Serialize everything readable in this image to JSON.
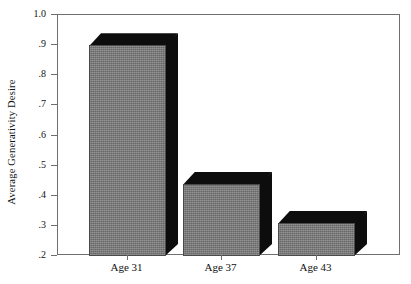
{
  "chart_data": {
    "type": "bar",
    "title": "",
    "subtitle": "",
    "xlabel": "",
    "ylabel": "Average Generativity Desire",
    "categories": [
      "Age 31",
      "Age 37",
      "Age 43"
    ],
    "values": [
      0.9,
      0.44,
      0.31
    ],
    "series": [
      {
        "name": "Average Generativity Desire",
        "values": [
          0.9,
          0.44,
          0.31
        ]
      }
    ],
    "ylim": [
      0.2,
      1.0
    ],
    "ytick_labels": [
      "1.0",
      ".9",
      ".8",
      ".7",
      ".6",
      ".5",
      ".4",
      ".3",
      ".2"
    ],
    "ytick_values": [
      1.0,
      0.9,
      0.8,
      0.7,
      0.6,
      0.5,
      0.4,
      0.3,
      0.2
    ],
    "grid": false,
    "legend": false,
    "legend_position": "none",
    "style": "3d-bar",
    "colors": {
      "bar_front": "#7d7d7d",
      "bar_shadow": "#0d0d0d",
      "axis": "#6f6f6f",
      "text": "#111111",
      "background": "#ffffff"
    },
    "annotations": []
  },
  "axes": {
    "y_title": "Average Generativity Desire",
    "y_ticks": [
      {
        "label": "1.0",
        "value": 1.0
      },
      {
        "label": ".9",
        "value": 0.9
      },
      {
        "label": ".8",
        "value": 0.8
      },
      {
        "label": ".7",
        "value": 0.7
      },
      {
        "label": ".6",
        "value": 0.6
      },
      {
        "label": ".5",
        "value": 0.5
      },
      {
        "label": ".4",
        "value": 0.4
      },
      {
        "label": ".3",
        "value": 0.3
      },
      {
        "label": ".2",
        "value": 0.2
      }
    ],
    "x_ticks": [
      {
        "label": "Age 31",
        "value": 0.9
      },
      {
        "label": "Age 37",
        "value": 0.44
      },
      {
        "label": "Age 43",
        "value": 0.31
      }
    ]
  }
}
